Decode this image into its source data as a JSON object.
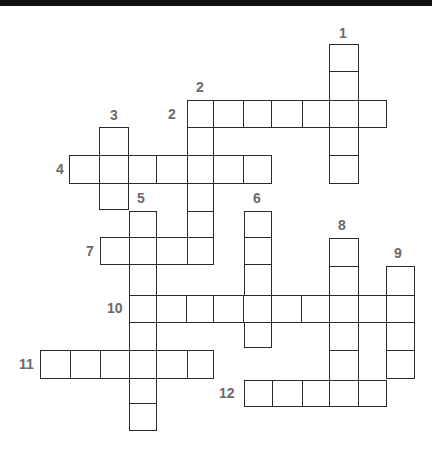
{
  "puzzle": {
    "type": "crossword",
    "colors": {
      "grid_line": "#2a2a2a",
      "number": "#6a6a6a",
      "cell_fill": "#ffffff",
      "top_bar": "#111111"
    },
    "entries": [
      {
        "id": "1-down",
        "number": "1",
        "direction": "down",
        "length": 5
      },
      {
        "id": "2-across",
        "number": "2",
        "direction": "across",
        "length": 7
      },
      {
        "id": "2-down",
        "number": "2",
        "direction": "down",
        "length": 6
      },
      {
        "id": "3-down",
        "number": "3",
        "direction": "down",
        "length": 3
      },
      {
        "id": "4-across",
        "number": "4",
        "direction": "across",
        "length": 7
      },
      {
        "id": "5-down",
        "number": "5",
        "direction": "down",
        "length": 8
      },
      {
        "id": "6-down",
        "number": "6",
        "direction": "down",
        "length": 5
      },
      {
        "id": "7-across",
        "number": "7",
        "direction": "across",
        "length": 4
      },
      {
        "id": "8-down",
        "number": "8",
        "direction": "down",
        "length": 6
      },
      {
        "id": "9-down",
        "number": "9",
        "direction": "down",
        "length": 4
      },
      {
        "id": "10-across",
        "number": "10",
        "direction": "across",
        "length": 10
      },
      {
        "id": "11-across",
        "number": "11",
        "direction": "across",
        "length": 6
      },
      {
        "id": "12-across",
        "number": "12",
        "direction": "across",
        "length": 5
      }
    ],
    "labels": {
      "n1": "1",
      "n2a": "2",
      "n2d": "2",
      "n3": "3",
      "n4": "4",
      "n5": "5",
      "n6": "6",
      "n7": "7",
      "n8": "8",
      "n9": "9",
      "n10": "10",
      "n11": "11",
      "n12": "12"
    }
  }
}
